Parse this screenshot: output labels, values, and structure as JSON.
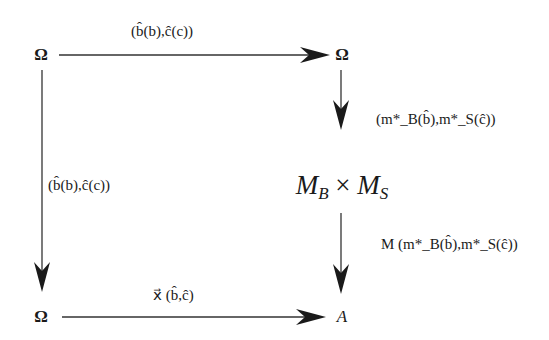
{
  "diagram": {
    "type": "commutative-diagram",
    "nodes": {
      "top_left": "Ω",
      "top_right": "Ω",
      "middle_right": "M_B × M_S",
      "bottom_left": "Ω",
      "bottom_right": "A"
    },
    "node_parts": {
      "mb_letter": "M",
      "mb_sub": "B",
      "times": " × ",
      "ms_letter": "M",
      "ms_sub": "S"
    },
    "edges": [
      {
        "from": "top_left",
        "to": "top_right",
        "label": "(b̂(b),ĉ(c))"
      },
      {
        "from": "top_left",
        "to": "bottom_left",
        "label": "(b̂(b),ĉ(c))"
      },
      {
        "from": "top_right",
        "to": "middle_right",
        "label": "(m*_B(b̂),m*_S(ĉ))"
      },
      {
        "from": "middle_right",
        "to": "bottom_right",
        "label": "M (m*_B(b̂),m*_S(ĉ))"
      },
      {
        "from": "bottom_left",
        "to": "bottom_right",
        "label": "x⃗ (b̂,ĉ)"
      }
    ],
    "labels": {
      "top_edge": "(b̂(b),ĉ(c))",
      "left_edge": "(b̂(b),ĉ(c))",
      "right_upper_edge": "(m*_B(b̂),m*_S(ĉ))",
      "right_lower_edge": "M (m*_B(b̂),m*_S(ĉ))",
      "bottom_edge": "x⃗ (b̂,ĉ)"
    },
    "colors": {
      "line": "#333333",
      "text": "#1a1a1a",
      "background": "#ffffff"
    }
  }
}
